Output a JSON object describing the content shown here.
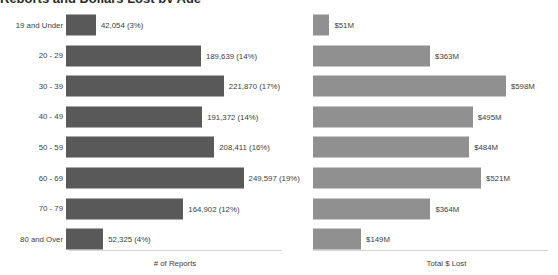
{
  "title": "Reports and Dollars Lost by Age",
  "chart_data": {
    "type": "bar",
    "orientation": "horizontal",
    "title": "Reports and Dollars Lost by Age",
    "categories": [
      "19 and Under",
      "20 - 29",
      "30 - 39",
      "40 - 49",
      "50 - 59",
      "60 - 69",
      "70 - 79",
      "80 and Over"
    ],
    "grid": false,
    "legend": "none",
    "panels": [
      {
        "name": "reports",
        "xlabel": "# of Reports",
        "bar_color": "#595959",
        "xlim": [
          0,
          260000
        ],
        "values": [
          42054,
          189639,
          221870,
          191372,
          208411,
          249597,
          164902,
          52325
        ],
        "percents": [
          3,
          14,
          17,
          14,
          16,
          19,
          12,
          4
        ],
        "data_labels": [
          "42,054 (3%)",
          "189,639 (14%)",
          "221,870 (17%)",
          "191,372 (14%)",
          "208,411 (16%)",
          "249,597 (19%)",
          "164,902 (12%)",
          "52,325 (4%)"
        ]
      },
      {
        "name": "dollars_lost",
        "xlabel": "Total $ Lost",
        "bar_color": "#909090",
        "xlim": [
          0,
          620
        ],
        "unit": "millions USD",
        "values": [
          51,
          363,
          598,
          495,
          484,
          521,
          364,
          149
        ],
        "data_labels": [
          "$51M",
          "$363M",
          "$598M",
          "$495M",
          "$484M",
          "$521M",
          "$364M",
          "$149M"
        ]
      }
    ]
  },
  "colors": {
    "reports_bar": "#595959",
    "lost_bar": "#909090",
    "axis_line": "#d4d4d4",
    "text": "#404040",
    "background": "#ffffff"
  }
}
